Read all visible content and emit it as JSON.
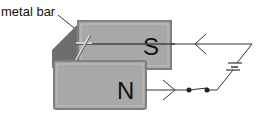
{
  "diagram": {
    "labels": {
      "metal_bar": "metal bar",
      "south_pole": "S",
      "north_pole": "N"
    },
    "colors": {
      "magnet_face": "#a8a8a8",
      "magnet_edge": "#808080",
      "magnet_side": "#6e6e6e",
      "wire": "#333333",
      "text": "#111111"
    }
  }
}
